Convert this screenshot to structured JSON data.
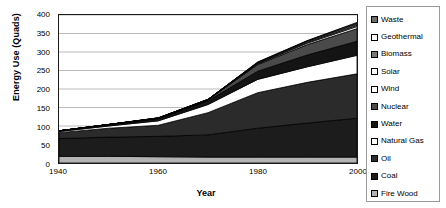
{
  "chart_data": {
    "type": "area",
    "title": "",
    "xlabel": "Year",
    "ylabel": "Energy Use (Quads)",
    "x": [
      1940,
      1950,
      1960,
      1970,
      1980,
      1990,
      2000
    ],
    "xlim": [
      1940,
      2000
    ],
    "ylim": [
      0,
      400
    ],
    "xticks": [
      1940,
      1960,
      1980,
      2000
    ],
    "yticks": [
      0,
      50,
      100,
      150,
      200,
      250,
      300,
      350,
      400
    ],
    "grid": "horizontal",
    "stacked": true,
    "legend_position": "right",
    "stack_order_bottom_to_top": [
      "Fire Wood",
      "Coal",
      "Oil",
      "Natural Gas",
      "Water",
      "Nuclear",
      "Wind",
      "Solar",
      "Biomass",
      "Geothermal",
      "Waste"
    ],
    "series": [
      {
        "name": "Fire Wood",
        "color": "#b3b3b3",
        "values": [
          18,
          18,
          17,
          16,
          16,
          16,
          16
        ]
      },
      {
        "name": "Coal",
        "color": "#1c1c1c",
        "values": [
          48,
          52,
          55,
          60,
          78,
          92,
          105
        ]
      },
      {
        "name": "Oil",
        "color": "#2b2b2b",
        "values": [
          16,
          24,
          30,
          60,
          96,
          110,
          120
        ]
      },
      {
        "name": "Natural Gas",
        "color": "#ffffff",
        "values": [
          3,
          6,
          12,
          22,
          36,
          42,
          50
        ]
      },
      {
        "name": "Water",
        "color": "#141414",
        "values": [
          2,
          4,
          6,
          10,
          22,
          32,
          38
        ]
      },
      {
        "name": "Nuclear",
        "color": "#4a4a4a",
        "values": [
          0,
          0,
          1,
          3,
          18,
          28,
          34
        ]
      },
      {
        "name": "Wind",
        "color": "#f2f2f2",
        "values": [
          0,
          0,
          0,
          0,
          2,
          4,
          6
        ]
      },
      {
        "name": "Solar",
        "color": "#e6e6e6",
        "values": [
          0,
          0,
          0,
          0,
          1,
          2,
          3
        ]
      },
      {
        "name": "Biomass",
        "color": "#787878",
        "values": [
          0,
          0,
          1,
          1,
          2,
          3,
          4
        ]
      },
      {
        "name": "Geothermal",
        "color": "#d9d9d9",
        "values": [
          0,
          0,
          0,
          0,
          1,
          1,
          2
        ]
      },
      {
        "name": "Waste",
        "color": "#6e6e6e",
        "values": [
          0,
          0,
          0,
          0,
          1,
          1,
          2
        ]
      }
    ],
    "totals": [
      87,
      104,
      122,
      172,
      273,
      331,
      380
    ]
  },
  "legend": {
    "items": [
      {
        "label": "Waste",
        "swatch": "#6e6e6e"
      },
      {
        "label": "Geothermal",
        "swatch": "#ffffff"
      },
      {
        "label": "Biomass",
        "swatch": "#787878"
      },
      {
        "label": "Solar",
        "swatch": "#ffffff"
      },
      {
        "label": "Wind",
        "swatch": "#ffffff"
      },
      {
        "label": "Nuclear",
        "swatch": "#4a4a4a"
      },
      {
        "label": "Water",
        "swatch": "#141414"
      },
      {
        "label": "Natural Gas",
        "swatch": "#ffffff"
      },
      {
        "label": "Oil",
        "swatch": "#2b2b2b"
      },
      {
        "label": "Coal",
        "swatch": "#1c1c1c"
      },
      {
        "label": "Fire Wood",
        "swatch": "#b3b3b3"
      }
    ]
  }
}
